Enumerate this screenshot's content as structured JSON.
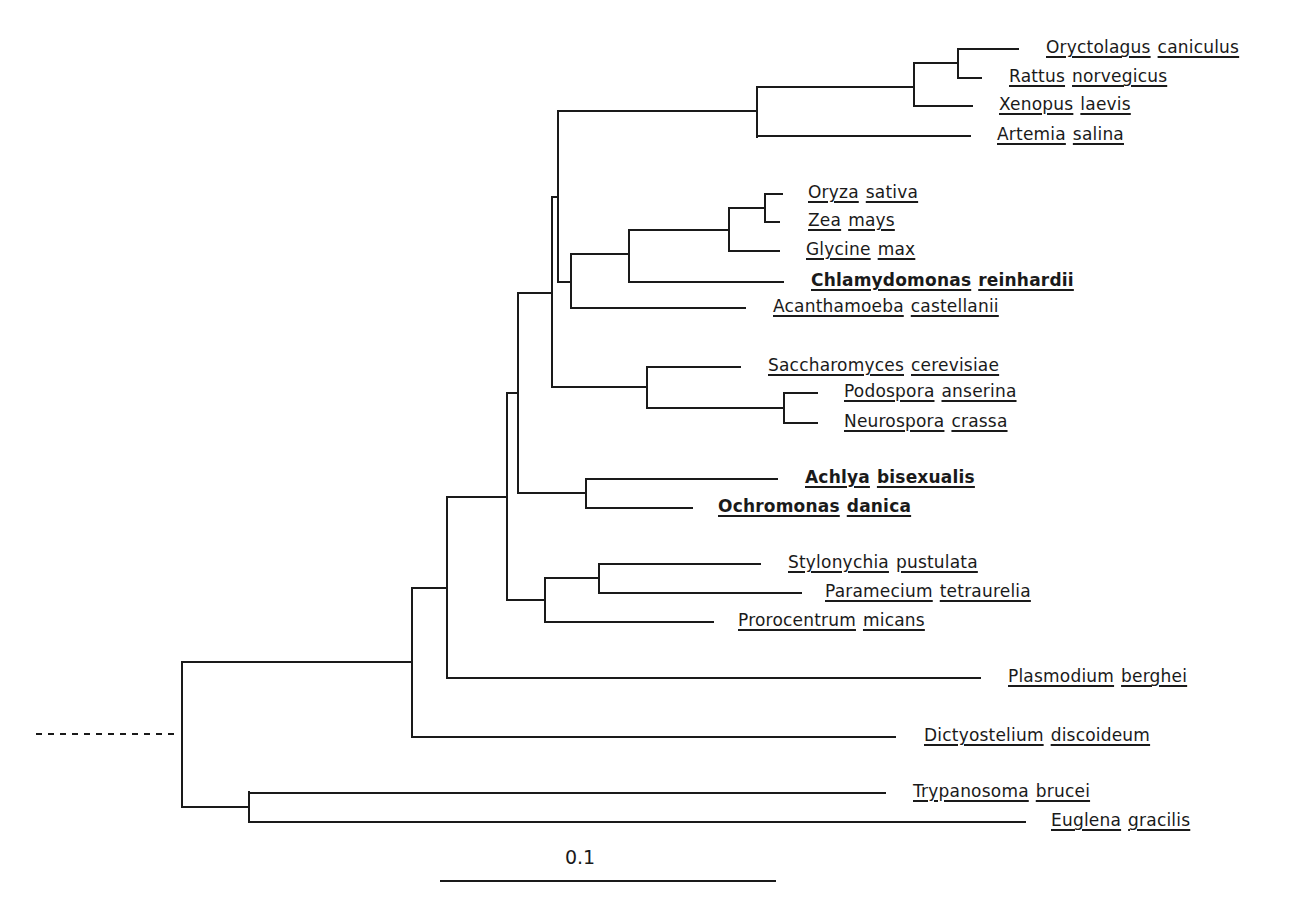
{
  "figure": {
    "type": "phylogenetic-tree",
    "line_color": "#1a1a1a",
    "background": "#ffffff",
    "scale_bar": {
      "label": "0.1",
      "x1": 440,
      "x2": 776,
      "y": 881,
      "label_x": 580,
      "label_y": 846
    },
    "root_stub": {
      "x1": 36,
      "x2": 176,
      "y": 734,
      "style": "dashed"
    },
    "taxa": [
      {
        "genus": "Oryctolagus",
        "species": "caniculus",
        "bold": false,
        "tip_x": 1018,
        "y": 49,
        "label_x": 1046
      },
      {
        "genus": "Rattus",
        "species": "norvegicus",
        "bold": false,
        "tip_x": 981,
        "y": 78,
        "label_x": 1009
      },
      {
        "genus": "Xenopus",
        "species": "laevis",
        "bold": false,
        "tip_x": 972,
        "y": 106,
        "label_x": 999
      },
      {
        "genus": "Artemia",
        "species": "salina",
        "bold": false,
        "tip_x": 970,
        "y": 136,
        "label_x": 997
      },
      {
        "genus": "Oryza",
        "species": "sativa",
        "bold": false,
        "tip_x": 782,
        "y": 194,
        "label_x": 808
      },
      {
        "genus": "Zea",
        "species": "mays",
        "bold": false,
        "tip_x": 779,
        "y": 222,
        "label_x": 808
      },
      {
        "genus": "Glycine",
        "species": "max",
        "bold": false,
        "tip_x": 779,
        "y": 251,
        "label_x": 806
      },
      {
        "genus": "Chlamydomonas",
        "species": "reinhardii",
        "bold": true,
        "tip_x": 783,
        "y": 282,
        "label_x": 811
      },
      {
        "genus": "Acanthamoeba",
        "species": "castellanii",
        "bold": false,
        "tip_x": 745,
        "y": 308,
        "label_x": 773
      },
      {
        "genus": "Saccharomyces",
        "species": "cerevisiae",
        "bold": false,
        "tip_x": 740,
        "y": 367,
        "label_x": 768
      },
      {
        "genus": "Podospora",
        "species": "anserina",
        "bold": false,
        "tip_x": 817,
        "y": 393,
        "label_x": 844
      },
      {
        "genus": "Neurospora",
        "species": "crassa",
        "bold": false,
        "tip_x": 817,
        "y": 423,
        "label_x": 844
      },
      {
        "genus": "Achlya",
        "species": "bisexualis",
        "bold": true,
        "tip_x": 777,
        "y": 479,
        "label_x": 805
      },
      {
        "genus": "Ochromonas",
        "species": "danica",
        "bold": true,
        "tip_x": 692,
        "y": 508,
        "label_x": 718
      },
      {
        "genus": "Stylonychia",
        "species": "pustulata",
        "bold": false,
        "tip_x": 760,
        "y": 564,
        "label_x": 788
      },
      {
        "genus": "Paramecium",
        "species": "tetraurelia",
        "bold": false,
        "tip_x": 801,
        "y": 593,
        "label_x": 825
      },
      {
        "genus": "Prorocentrum",
        "species": "micans",
        "bold": false,
        "tip_x": 713,
        "y": 622,
        "label_x": 738
      },
      {
        "genus": "Plasmodium",
        "species": "berghei",
        "bold": false,
        "tip_x": 980,
        "y": 678,
        "label_x": 1008
      },
      {
        "genus": "Dictyostelium",
        "species": "discoideum",
        "bold": false,
        "tip_x": 895,
        "y": 737,
        "label_x": 924
      },
      {
        "genus": "Trypanosoma",
        "species": "brucei",
        "bold": false,
        "tip_x": 885,
        "y": 793,
        "label_x": 913
      },
      {
        "genus": "Euglena",
        "species": "gracilis",
        "bold": false,
        "tip_x": 1025,
        "y": 822,
        "label_x": 1051
      }
    ],
    "nodes": [
      {
        "id": "root",
        "x": 182,
        "y1": 662,
        "y2": 807
      },
      {
        "id": "kinetoplastids",
        "x": 249,
        "y1": 792,
        "y2": 822,
        "parent_y": 807
      },
      {
        "id": "E",
        "x": 412,
        "y1": 588,
        "y2": 737,
        "parent_y": 662
      },
      {
        "id": "D",
        "x": 447,
        "y1": 497,
        "y2": 678,
        "parent_y": 588
      },
      {
        "id": "C",
        "x": 507,
        "y1": 393,
        "y2": 600,
        "parent_y": 497
      },
      {
        "id": "ciliates-dino",
        "x": 545,
        "y1": 578,
        "y2": 622,
        "parent_y": 600
      },
      {
        "id": "ciliates",
        "x": 599,
        "y1": 564,
        "y2": 593,
        "parent_y": 578
      },
      {
        "id": "B",
        "x": 518,
        "y1": 293,
        "y2": 493,
        "parent_y": 393
      },
      {
        "id": "stramenopiles",
        "x": 586,
        "y1": 479,
        "y2": 508,
        "parent_y": 493
      },
      {
        "id": "A",
        "x": 552,
        "y1": 197,
        "y2": 387,
        "parent_y": 293
      },
      {
        "id": "fungi",
        "x": 647,
        "y1": 367,
        "y2": 408,
        "parent_y": 387
      },
      {
        "id": "ascomycetes",
        "x": 784,
        "y1": 393,
        "y2": 423,
        "parent_y": 408
      },
      {
        "id": "animals-plants",
        "x": 558,
        "y1": 111,
        "y2": 282,
        "parent_y": 197
      },
      {
        "id": "animals",
        "x": 757,
        "y1": 87,
        "y2": 137,
        "parent_y": 111
      },
      {
        "id": "vertebrates",
        "x": 914,
        "y1": 63,
        "y2": 106,
        "parent_y": 87
      },
      {
        "id": "mammals",
        "x": 958,
        "y1": 49,
        "y2": 78,
        "parent_y": 63
      },
      {
        "id": "plants-amoeba",
        "x": 571,
        "y1": 254,
        "y2": 308,
        "parent_y": 282
      },
      {
        "id": "green-plants",
        "x": 629,
        "y1": 230,
        "y2": 282,
        "parent_y": 254
      },
      {
        "id": "land-plants",
        "x": 729,
        "y1": 208,
        "y2": 251,
        "parent_y": 230
      },
      {
        "id": "grasses",
        "x": 765,
        "y1": 194,
        "y2": 222,
        "parent_y": 208
      }
    ],
    "edges": [
      {
        "from_x": 182,
        "to_x": 249,
        "y": 807
      },
      {
        "from_x": 249,
        "to_x": 885,
        "y": 793
      },
      {
        "from_x": 249,
        "to_x": 1025,
        "y": 822
      },
      {
        "from_x": 182,
        "to_x": 412,
        "y": 662
      },
      {
        "from_x": 412,
        "to_x": 895,
        "y": 737
      },
      {
        "from_x": 412,
        "to_x": 447,
        "y": 588
      },
      {
        "from_x": 447,
        "to_x": 980,
        "y": 678
      },
      {
        "from_x": 447,
        "to_x": 507,
        "y": 497
      },
      {
        "from_x": 507,
        "to_x": 545,
        "y": 600
      },
      {
        "from_x": 545,
        "to_x": 599,
        "y": 578
      },
      {
        "from_x": 599,
        "to_x": 760,
        "y": 564
      },
      {
        "from_x": 599,
        "to_x": 801,
        "y": 593
      },
      {
        "from_x": 545,
        "to_x": 713,
        "y": 622
      },
      {
        "from_x": 507,
        "to_x": 518,
        "y": 393
      },
      {
        "from_x": 518,
        "to_x": 586,
        "y": 493
      },
      {
        "from_x": 586,
        "to_x": 777,
        "y": 479
      },
      {
        "from_x": 586,
        "to_x": 692,
        "y": 508
      },
      {
        "from_x": 518,
        "to_x": 552,
        "y": 293
      },
      {
        "from_x": 552,
        "to_x": 647,
        "y": 387
      },
      {
        "from_x": 647,
        "to_x": 740,
        "y": 367
      },
      {
        "from_x": 647,
        "to_x": 784,
        "y": 408
      },
      {
        "from_x": 784,
        "to_x": 817,
        "y": 393
      },
      {
        "from_x": 784,
        "to_x": 817,
        "y": 423
      },
      {
        "from_x": 552,
        "to_x": 558,
        "y": 197
      },
      {
        "from_x": 558,
        "to_x": 757,
        "y": 111
      },
      {
        "from_x": 757,
        "to_x": 914,
        "y": 87
      },
      {
        "from_x": 914,
        "to_x": 958,
        "y": 63
      },
      {
        "from_x": 958,
        "to_x": 1018,
        "y": 49
      },
      {
        "from_x": 958,
        "to_x": 981,
        "y": 78
      },
      {
        "from_x": 914,
        "to_x": 972,
        "y": 106
      },
      {
        "from_x": 757,
        "to_x": 970,
        "y": 136
      },
      {
        "from_x": 558,
        "to_x": 571,
        "y": 282
      },
      {
        "from_x": 571,
        "to_x": 629,
        "y": 254
      },
      {
        "from_x": 629,
        "to_x": 729,
        "y": 230
      },
      {
        "from_x": 729,
        "to_x": 765,
        "y": 208
      },
      {
        "from_x": 765,
        "to_x": 782,
        "y": 194
      },
      {
        "from_x": 765,
        "to_x": 779,
        "y": 222
      },
      {
        "from_x": 729,
        "to_x": 779,
        "y": 251
      },
      {
        "from_x": 629,
        "to_x": 783,
        "y": 282
      },
      {
        "from_x": 571,
        "to_x": 745,
        "y": 308
      }
    ]
  }
}
